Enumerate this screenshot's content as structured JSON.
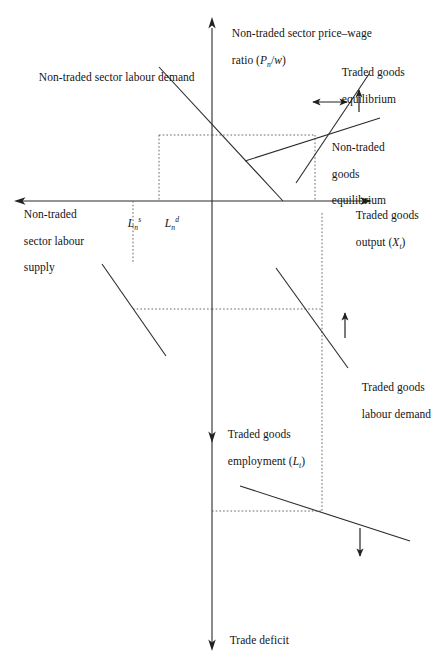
{
  "figure": {
    "type": "economics-four-quadrant-diagram",
    "background": "#ffffff",
    "line_color": "#2b2b2b",
    "text_color": "#141414"
  },
  "axes": {
    "vertical_top_label_line1": "Non-traded sector price–wage",
    "vertical_top_label_line2_pre": "ratio (",
    "vertical_top_label_line2_var": "P",
    "vertical_top_label_line2_sub": "n",
    "vertical_top_label_line2_mid": "/",
    "vertical_top_label_line2_w": "w",
    "vertical_top_label_line2_post": ")",
    "vertical_bottom_label_line1": "Traded goods",
    "vertical_bottom_label_line2_pre": "employment (",
    "vertical_bottom_label_line2_var": "L",
    "vertical_bottom_label_line2_sub": "t",
    "vertical_bottom_label_line2_post": ")",
    "horizontal_right_label_line1": "Traded goods",
    "horizontal_right_label_line2_pre": "output (",
    "horizontal_right_label_line2_var": "X",
    "horizontal_right_label_line2_sub": "t",
    "horizontal_right_label_line2_post": ")",
    "horizontal_left_label_line1": "Non-traded",
    "horizontal_left_label_line2": "sector labour",
    "horizontal_left_label_line3": "supply",
    "bottom_end_label": "Trade deficit"
  },
  "curves": {
    "nontraded_labour_demand": "Non-traded sector labour demand",
    "traded_goods_equilibrium_line1": "Traded goods",
    "traded_goods_equilibrium_line2": "equilibrium",
    "nontraded_goods_equilibrium_line1": "Non-traded",
    "nontraded_goods_equilibrium_line2": "goods",
    "nontraded_goods_equilibrium_line3": "equilibrium",
    "traded_goods_labour_demand_line1": "Traded goods",
    "traded_goods_labour_demand_line2": "labour demand"
  },
  "markers": {
    "ln_supply_var": "L",
    "ln_supply_sub": "n",
    "ln_supply_sup": "s",
    "ln_demand_var": "L",
    "ln_demand_sub": "n",
    "ln_demand_sup": "d"
  },
  "arrows": {
    "horizontal_double_arrow_quadrant1": "double-headed-horizontal-arrow",
    "up_arrow_quadrant1": "up-arrow",
    "up_arrow_quadrant4": "up-arrow",
    "down_arrow_bottom": "down-arrow",
    "axis_top_arrow": "up-arrow",
    "axis_bottom_arrow": "down-arrow",
    "axis_left_arrow": "left-arrow",
    "axis_right_arrow": "right-arrow",
    "axis_mid_down_arrow": "down-arrow"
  }
}
